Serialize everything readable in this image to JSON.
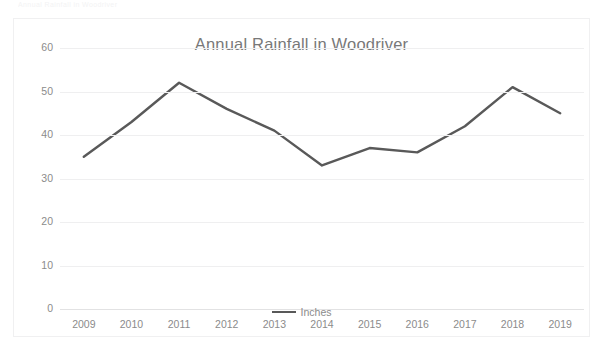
{
  "ghost_text": "Annual Rainfall in Woodriver",
  "chart": {
    "title": "Annual Rainfall in Woodriver",
    "legend_label": "Inches",
    "line_color": "#595959",
    "grid_color": "#efeff0",
    "text_color": "#8b8b8b",
    "title_color": "#787878",
    "background": "#ffffff",
    "border_color": "#f0f0f1"
  },
  "chart_data": {
    "type": "line",
    "title": "Annual Rainfall in Woodriver",
    "subtitle": "",
    "xlabel": "",
    "ylabel": "",
    "categories": [
      "2009",
      "2010",
      "2011",
      "2012",
      "2013",
      "2014",
      "2015",
      "2016",
      "2017",
      "2018",
      "2019"
    ],
    "series": [
      {
        "name": "Inches",
        "color": "#595959",
        "values": [
          35,
          43,
          52,
          46,
          41,
          33,
          37,
          36,
          42,
          51,
          45
        ]
      }
    ],
    "y_ticks": [
      0,
      10,
      20,
      30,
      40,
      50,
      60
    ],
    "ylim": [
      0,
      60
    ],
    "grid": true,
    "grid_axis": "y",
    "legend": true,
    "legend_position": "bottom",
    "markers": false,
    "annotations": []
  }
}
